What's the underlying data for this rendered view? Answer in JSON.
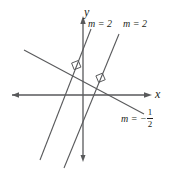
{
  "figure": {
    "type": "coordinate-plane-diagram",
    "background_color": "#ffffff",
    "line_color": "#58595b",
    "text_color": "#231f20",
    "axes": {
      "x_label": "x",
      "y_label": "y",
      "x_axis_y_px": 95,
      "y_axis_x_px": 83,
      "x_axis_from_px": 8,
      "x_axis_to_px": 152,
      "y_axis_from_px": 16,
      "y_axis_to_px": 162
    },
    "lines": [
      {
        "id": "line-1",
        "slope_label": "m = 2",
        "slope_value": 2,
        "kind": "positive-slope",
        "x1": 40,
        "y1": 160,
        "x2": 91,
        "y2": 29
      },
      {
        "id": "line-2",
        "slope_label": "m = 2",
        "slope_value": 2,
        "kind": "positive-slope",
        "x1": 64,
        "y1": 168,
        "x2": 119,
        "y2": 34
      },
      {
        "id": "line-3",
        "slope_label_prefix": "m = −",
        "slope_numerator": "1",
        "slope_denominator": "2",
        "slope_value": -0.5,
        "kind": "negative-slope",
        "x1": 24,
        "y1": 50,
        "x2": 144,
        "y2": 114
      }
    ],
    "right_angle_marks": [
      {
        "id": "right-angle-1",
        "cx": 76,
        "cy": 67,
        "note": "intersection of line-1 and line-3"
      },
      {
        "id": "right-angle-2",
        "cx": 100,
        "cy": 80,
        "note": "intersection of line-2 and line-3"
      }
    ]
  }
}
